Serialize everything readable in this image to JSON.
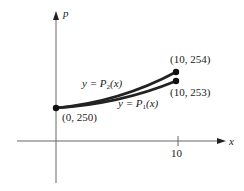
{
  "diagram": {
    "axes": {
      "x_label": "x",
      "y_label": "p",
      "x_tick_label": "10"
    },
    "points": [
      {
        "label": "(0, 250)"
      },
      {
        "label": "(10, 254)"
      },
      {
        "label": "(10, 253)"
      }
    ],
    "curves": [
      {
        "label": "y = P₂(x)",
        "prefix": "y = ",
        "fn": "P",
        "sub": "2",
        "arg": "(x)"
      },
      {
        "label": "y = P₁(x)",
        "prefix": "y = ",
        "fn": "P",
        "sub": "1",
        "arg": "(x)"
      }
    ],
    "colors": {
      "axis": "#555555",
      "curve": "#222222",
      "text": "#222222"
    }
  }
}
